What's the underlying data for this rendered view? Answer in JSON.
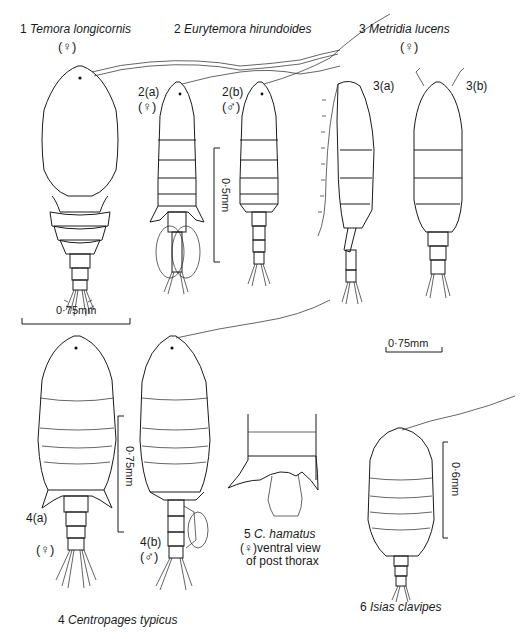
{
  "figure": {
    "species": [
      {
        "number": "1",
        "name": "Temora longicornis",
        "sex": "(♀)"
      },
      {
        "number": "2",
        "name": "Eurytemora hirundoides",
        "views": [
          {
            "label": "2(a)",
            "sex": "(♀)"
          },
          {
            "label": "2(b)",
            "sex": "(♂)"
          }
        ]
      },
      {
        "number": "3",
        "name": "Metridia lucens",
        "sex": "(♀)",
        "views": [
          {
            "label": "3(a)"
          },
          {
            "label": "3(b)"
          }
        ]
      },
      {
        "number": "4",
        "name": "Centropages typicus",
        "views": [
          {
            "label": "4(a)",
            "sex": "(♀)"
          },
          {
            "label": "4(b)",
            "sex": "(♂)"
          }
        ]
      },
      {
        "number": "5",
        "name": "C. hamatus",
        "sex": "(♀)",
        "caption_line1": "ventral view",
        "caption_line2": "of post thorax"
      },
      {
        "number": "6",
        "name": "Isias clavipes"
      }
    ],
    "scale_bars": {
      "s1": "0·75mm",
      "s2": "0·5mm",
      "s3": "0·75mm",
      "s4": "0·75mm",
      "s6": "0·6mm"
    }
  }
}
